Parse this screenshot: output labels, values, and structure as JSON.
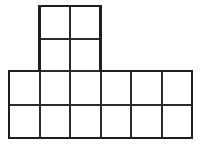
{
  "figure": {
    "background_color": "#ffffff",
    "line_color": "#2b2b2b",
    "outline_color": "#1f1f1f",
    "cell_fill": "#ffffff",
    "line_width_px": 2,
    "unit_cell_width_px": 30.5,
    "unit_cell_height_px": 32.5,
    "total_unit_squares": 16,
    "canvas": {
      "width_px": 201,
      "height_px": 144
    },
    "geometry": {
      "x_gridlines": [
        9,
        39.5,
        70,
        100.5,
        131,
        161.5,
        192
      ],
      "y_gridlines_top_block": [
        6,
        38.5,
        71
      ],
      "y_gridlines_bottom_block": [
        71,
        104.5,
        138
      ],
      "bottom_rect": {
        "x": 9,
        "y": 71,
        "width": 183,
        "height": 67,
        "cols": 6,
        "rows": 2
      },
      "top_block": {
        "x": 39.5,
        "y": 6,
        "width": 61,
        "height": 65,
        "cols": 2,
        "rows": 2
      }
    },
    "cells": [
      {
        "id": "top-r1-c1",
        "row": 1,
        "col": 3,
        "x": 39.5,
        "y": 6,
        "w": 30.5,
        "h": 32.5
      },
      {
        "id": "top-r1-c2",
        "row": 1,
        "col": 4,
        "x": 70,
        "y": 6,
        "w": 30.5,
        "h": 32.5
      },
      {
        "id": "top-r2-c1",
        "row": 2,
        "col": 3,
        "x": 39.5,
        "y": 38.5,
        "w": 30.5,
        "h": 32.5
      },
      {
        "id": "top-r2-c2",
        "row": 2,
        "col": 4,
        "x": 70,
        "y": 38.5,
        "w": 30.5,
        "h": 32.5
      },
      {
        "id": "bot-r3-c1",
        "row": 3,
        "col": 1,
        "x": 9,
        "y": 71,
        "w": 30.5,
        "h": 33.5
      },
      {
        "id": "bot-r3-c2",
        "row": 3,
        "col": 2,
        "x": 39.5,
        "y": 71,
        "w": 30.5,
        "h": 33.5
      },
      {
        "id": "bot-r3-c3",
        "row": 3,
        "col": 3,
        "x": 70,
        "y": 71,
        "w": 30.5,
        "h": 33.5
      },
      {
        "id": "bot-r3-c4",
        "row": 3,
        "col": 4,
        "x": 100.5,
        "y": 71,
        "w": 30.5,
        "h": 33.5
      },
      {
        "id": "bot-r3-c5",
        "row": 3,
        "col": 5,
        "x": 131,
        "y": 71,
        "w": 30.5,
        "h": 33.5
      },
      {
        "id": "bot-r3-c6",
        "row": 3,
        "col": 6,
        "x": 161.5,
        "y": 71,
        "w": 30.5,
        "h": 33.5
      },
      {
        "id": "bot-r4-c1",
        "row": 4,
        "col": 1,
        "x": 9,
        "y": 104.5,
        "w": 30.5,
        "h": 33.5
      },
      {
        "id": "bot-r4-c2",
        "row": 4,
        "col": 2,
        "x": 39.5,
        "y": 104.5,
        "w": 30.5,
        "h": 33.5
      },
      {
        "id": "bot-r4-c3",
        "row": 4,
        "col": 3,
        "x": 70,
        "y": 104.5,
        "w": 30.5,
        "h": 33.5
      },
      {
        "id": "bot-r4-c4",
        "row": 4,
        "col": 4,
        "x": 100.5,
        "y": 104.5,
        "w": 30.5,
        "h": 33.5
      },
      {
        "id": "bot-r4-c5",
        "row": 4,
        "col": 5,
        "x": 131,
        "y": 104.5,
        "w": 30.5,
        "h": 33.5
      },
      {
        "id": "bot-r4-c6",
        "row": 4,
        "col": 6,
        "x": 161.5,
        "y": 104.5,
        "w": 30.5,
        "h": 33.5
      }
    ],
    "internal_lines": {
      "vertical": [
        {
          "x": 39.5,
          "y1": 6,
          "y2": 138
        },
        {
          "x": 70,
          "y1": 6,
          "y2": 138
        },
        {
          "x": 100.5,
          "y1": 6,
          "y2": 138
        },
        {
          "x": 131,
          "y1": 71,
          "y2": 138
        },
        {
          "x": 161.5,
          "y1": 71,
          "y2": 138
        }
      ],
      "horizontal": [
        {
          "y": 38.5,
          "x1": 39.5,
          "x2": 100.5
        },
        {
          "y": 71,
          "x1": 9,
          "x2": 192
        },
        {
          "y": 104.5,
          "x1": 9,
          "x2": 192
        }
      ]
    },
    "outline_path": "M 39.5 6 L 100.5 6 L 100.5 71 L 192 71 L 192 138 L 9 138 L 9 71 L 39.5 71 Z"
  }
}
